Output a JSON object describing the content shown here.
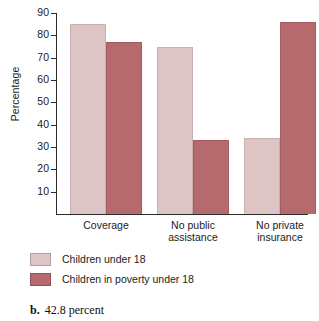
{
  "chart_data": {
    "type": "bar",
    "title": "",
    "xlabel": "",
    "ylabel": "Percentage",
    "ylim": [
      0,
      90
    ],
    "yticks": [
      10,
      20,
      30,
      40,
      50,
      60,
      70,
      80,
      90
    ],
    "grid": false,
    "legend_position": "below-left",
    "categories": [
      "Coverage",
      "No public\nassistance",
      "No private\ninsurance"
    ],
    "series": [
      {
        "name": "Children under 18",
        "color": "#ddc5c5",
        "values": [
          85,
          75,
          34
        ]
      },
      {
        "name": "Children in poverty under 18",
        "color": "#b66a6e",
        "values": [
          77,
          33,
          86
        ]
      }
    ]
  },
  "axis": {
    "y_title": "Percentage",
    "y_tick_labels": [
      "90",
      "80",
      "70",
      "60",
      "50",
      "40",
      "30",
      "20",
      "10"
    ],
    "x_tick_labels": [
      "Coverage",
      "No public\nassistance",
      "No private\ninsurance"
    ]
  },
  "legend": {
    "entries": [
      {
        "label": "Children under 18",
        "color": "#ddc5c5"
      },
      {
        "label": "Children in poverty under 18",
        "color": "#b66a6e"
      }
    ]
  },
  "caption": {
    "marker": "b.",
    "text": "42.8 percent"
  }
}
